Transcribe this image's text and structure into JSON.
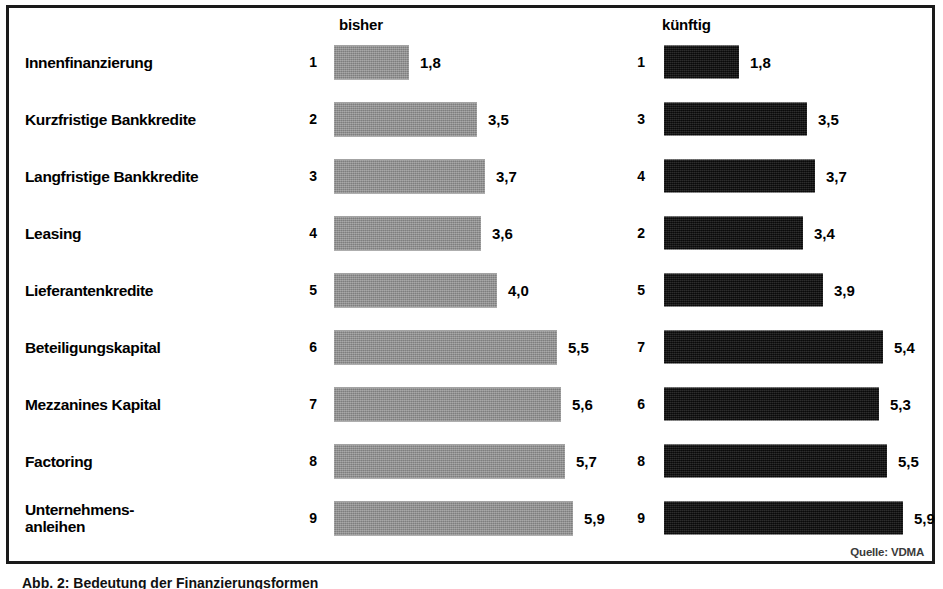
{
  "figure": {
    "source_note": "Quelle: VDMA",
    "caption": "Abb. 2: Bedeutung der Finanzierungsformen"
  },
  "chart_data": {
    "type": "bar",
    "orientation": "horizontal",
    "title": "",
    "xlabel": "",
    "ylabel": "",
    "xlim": [
      0,
      6.2
    ],
    "grid": false,
    "legend_position": "top",
    "categories": [
      "Innenfinanzierung",
      "Kurzfristige Bankkredite",
      "Langfristige Bankkredite",
      "Leasing",
      "Lieferantenkredite",
      "Beteiligungskapital",
      "Mezzanines Kapital",
      "Factoring",
      "Unternehmens-\nanleihen"
    ],
    "series": [
      {
        "name": "bisher",
        "color": "#8d8d8d",
        "values": [
          1.8,
          3.5,
          3.7,
          3.6,
          4.0,
          5.5,
          5.6,
          5.7,
          5.9
        ],
        "value_labels": [
          "1,8",
          "3,5",
          "3,7",
          "3,6",
          "4,0",
          "5,5",
          "5,6",
          "5,7",
          "5,9"
        ],
        "ranks": [
          "1",
          "2",
          "3",
          "4",
          "5",
          "6",
          "7",
          "8",
          "9"
        ]
      },
      {
        "name": "künftig",
        "color": "#111111",
        "values": [
          1.8,
          3.5,
          3.7,
          3.4,
          3.9,
          5.4,
          5.3,
          5.5,
          5.9
        ],
        "value_labels": [
          "1,8",
          "3,5",
          "3,7",
          "3,4",
          "3,9",
          "5,4",
          "5,3",
          "5,5",
          "5,9"
        ],
        "ranks": [
          "1",
          "3",
          "4",
          "2",
          "5",
          "7",
          "6",
          "8",
          "9"
        ]
      }
    ]
  }
}
